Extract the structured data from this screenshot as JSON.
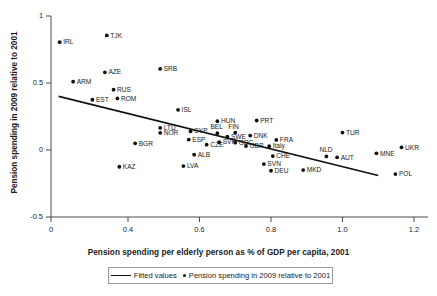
{
  "chart_data": {
    "type": "scatter",
    "title": "",
    "xlabel": "Pension spending per elderly person as % of GDP per capita, 2001",
    "ylabel": "Pension spending in 2009 relative to 2001",
    "xlim": [
      0,
      1.2
    ],
    "ylim": [
      -0.5,
      1
    ],
    "xticks": [
      "0",
      "0.4",
      "0.6",
      "0.8",
      "1.0",
      "1.2"
    ],
    "xtick_values": [
      0,
      0.4,
      0.6,
      0.8,
      1.0,
      1.2
    ],
    "yticks": [
      "1",
      "0.5",
      "0",
      "-0.5"
    ],
    "ytick_values": [
      1,
      0.5,
      0,
      -0.5
    ],
    "grid": false,
    "legend_position": "bottom",
    "legend": [
      {
        "label": "Fitted values",
        "marker": "line"
      },
      {
        "label": "Pension spending in 2009 relative to 2001",
        "marker": "dot"
      }
    ],
    "fit_line": {
      "x_start": 0.04,
      "y_start": 0.4,
      "x_end": 1.1,
      "y_end": -0.19
    },
    "points": [
      {
        "label": "IRL",
        "x": 0.045,
        "y": 0.805,
        "label_side": "right"
      },
      {
        "label": "TJK",
        "x": 0.29,
        "y": 0.855,
        "label_side": "right"
      },
      {
        "label": "ARM",
        "x": 0.115,
        "y": 0.51,
        "label_side": "right"
      },
      {
        "label": "AZE",
        "x": 0.28,
        "y": 0.58,
        "label_side": "right"
      },
      {
        "label": "SRB",
        "x": 0.49,
        "y": 0.605,
        "label_side": "right"
      },
      {
        "label": "RUS",
        "x": 0.325,
        "y": 0.45,
        "label_side": "right"
      },
      {
        "label": "ROM",
        "x": 0.345,
        "y": 0.385,
        "label_side": "right"
      },
      {
        "label": "EST",
        "x": 0.215,
        "y": 0.375,
        "label_side": "right"
      },
      {
        "label": "ISL",
        "x": 0.54,
        "y": 0.3,
        "label_side": "right"
      },
      {
        "label": "HUN",
        "x": 0.65,
        "y": 0.215,
        "label_side": "right"
      },
      {
        "label": "PRT",
        "x": 0.76,
        "y": 0.22,
        "label_side": "right"
      },
      {
        "label": "LTU",
        "x": 0.49,
        "y": 0.165,
        "label_side": "right"
      },
      {
        "label": "NOR",
        "x": 0.49,
        "y": 0.128,
        "label_side": "right"
      },
      {
        "label": "CYP",
        "x": 0.575,
        "y": 0.14,
        "label_side": "right"
      },
      {
        "label": "ESP",
        "x": 0.57,
        "y": 0.078,
        "label_side": "right"
      },
      {
        "label": "BGR",
        "x": 0.42,
        "y": 0.05,
        "label_side": "right"
      },
      {
        "label": "CZE",
        "x": 0.62,
        "y": 0.04,
        "label_side": "right"
      },
      {
        "label": "ALB",
        "x": 0.585,
        "y": -0.035,
        "label_side": "right"
      },
      {
        "label": "LVA",
        "x": 0.555,
        "y": -0.12,
        "label_side": "right"
      },
      {
        "label": "KAZ",
        "x": 0.355,
        "y": -0.125,
        "label_side": "right"
      },
      {
        "label": "BEL",
        "x": 0.65,
        "y": 0.125,
        "label_side": "above"
      },
      {
        "label": "FIN",
        "x": 0.7,
        "y": 0.13,
        "label_side": "above"
      },
      {
        "label": "SWE",
        "x": 0.678,
        "y": 0.1,
        "label_side": "right"
      },
      {
        "label": "DNK",
        "x": 0.742,
        "y": 0.108,
        "label_side": "right"
      },
      {
        "label": "SVK",
        "x": 0.655,
        "y": 0.058,
        "label_side": "right"
      },
      {
        "label": "GRC",
        "x": 0.7,
        "y": 0.055,
        "label_side": "right"
      },
      {
        "label": "GBR",
        "x": 0.73,
        "y": 0.03,
        "label_side": "right"
      },
      {
        "label": "FRA",
        "x": 0.815,
        "y": 0.075,
        "label_side": "right"
      },
      {
        "label": "Italy",
        "x": 0.795,
        "y": 0.028,
        "label_side": "right"
      },
      {
        "label": "CHE",
        "x": 0.805,
        "y": -0.045,
        "label_side": "right"
      },
      {
        "label": "SVN",
        "x": 0.78,
        "y": -0.105,
        "label_side": "right"
      },
      {
        "label": "DEU",
        "x": 0.8,
        "y": -0.155,
        "label_side": "right"
      },
      {
        "label": "MKD",
        "x": 0.89,
        "y": -0.15,
        "label_side": "right"
      },
      {
        "label": "NLD",
        "x": 0.955,
        "y": -0.048,
        "label_side": "above"
      },
      {
        "label": "AUT",
        "x": 0.985,
        "y": -0.055,
        "label_side": "right"
      },
      {
        "label": "TUR",
        "x": 1.0,
        "y": 0.13,
        "label_side": "right"
      },
      {
        "label": "MNE",
        "x": 1.095,
        "y": -0.025,
        "label_side": "right"
      },
      {
        "label": "UKR",
        "x": 1.165,
        "y": 0.02,
        "label_side": "right"
      },
      {
        "label": "POL",
        "x": 1.148,
        "y": -0.18,
        "label_side": "right"
      }
    ]
  },
  "legend_box": {
    "fitted_label": "Fitted values",
    "points_label": "Pension spending in 2009 relative to 2001"
  }
}
